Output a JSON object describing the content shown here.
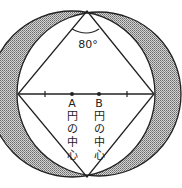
{
  "diagram": {
    "angle_label": "80°",
    "center_a_label": [
      "A",
      "円",
      "の",
      "中",
      "心"
    ],
    "center_b_label": [
      "B",
      "円",
      "の",
      "中",
      "心"
    ],
    "colors": {
      "line": "#222222",
      "shade": "#9a9a9a",
      "background": "#ffffff"
    },
    "geometry": {
      "top_vertex": [
        87,
        11
      ],
      "bottom_vertex": [
        87,
        177
      ],
      "left_vertex": [
        18,
        94
      ],
      "right_vertex": [
        154,
        94
      ],
      "center_a": [
        72,
        94
      ],
      "center_b": [
        99,
        94
      ],
      "ticks_x": [
        45,
        127
      ],
      "radius": 82
    }
  }
}
